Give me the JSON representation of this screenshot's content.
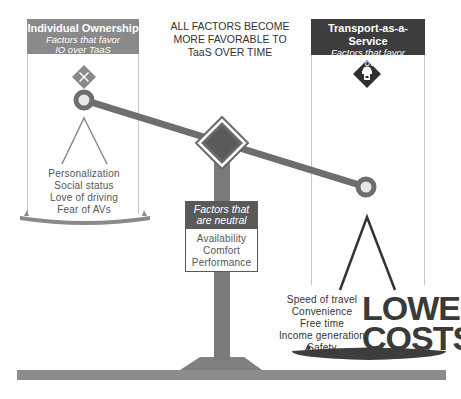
{
  "center_note": {
    "lines": [
      "ALL FACTORS BECOME",
      "MORE FAVORABLE TO",
      "TaaS OVER TIME"
    ]
  },
  "left_panel": {
    "title": "Individual Ownership",
    "subtitle_lines": [
      "Factors that favor",
      "IO over TaaS"
    ],
    "icon": "car-crash-diamond-icon",
    "header_color": "#8a8a8a",
    "factors": [
      "Personalization",
      "Social status",
      "Love of driving",
      "Fear of AVs"
    ]
  },
  "right_panel": {
    "title": "Transport-as-a-Service",
    "subtitle_lines": [
      "Factors that favor",
      "TaaS over IO"
    ],
    "icon": "robot-vehicle-diamond-icon",
    "header_color": "#3d3d3d",
    "factors": [
      "Speed of travel",
      "Convenience",
      "Free time",
      "Income generation",
      "Safety"
    ],
    "highlight_lines": [
      "LOWER",
      "COSTS"
    ]
  },
  "neutral_panel": {
    "header_lines": [
      "Factors that",
      "are neutral"
    ],
    "header_color": "#5a5a5a",
    "factors": [
      "Availability",
      "Comfort",
      "Performance"
    ]
  },
  "colors": {
    "beam": "#707070",
    "base": "#8c8c8c",
    "dark": "#3d3d3d"
  }
}
